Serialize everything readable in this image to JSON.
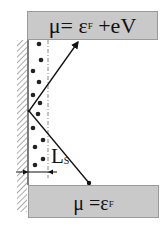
{
  "diagram": {
    "top_reservoir": {
      "mu": "μ",
      "eq": "= ε",
      "sub": "F",
      "rest": " +eV"
    },
    "bottom_reservoir": {
      "mu": "μ",
      "eq": " =ε",
      "sub": "F"
    },
    "slip_length_label": {
      "main": "L",
      "sub": "S"
    },
    "colors": {
      "reservoir_fill": "#c9c9c9",
      "reservoir_border": "#9a9a9a",
      "line": "#111111",
      "dashed_line": "#888888",
      "hatch": "#555555"
    },
    "particles": [
      [
        39,
        44
      ],
      [
        41,
        60
      ],
      [
        33,
        71
      ],
      [
        39,
        82
      ],
      [
        33,
        95
      ],
      [
        40,
        103
      ],
      [
        38,
        114
      ],
      [
        33,
        128
      ],
      [
        43,
        140
      ],
      [
        35,
        147
      ],
      [
        43,
        159
      ],
      [
        35,
        165
      ]
    ],
    "profile_apex": [
      29,
      111
    ],
    "profile_top_end": [
      79,
      40
    ],
    "profile_bottom_end": [
      89,
      183
    ]
  }
}
